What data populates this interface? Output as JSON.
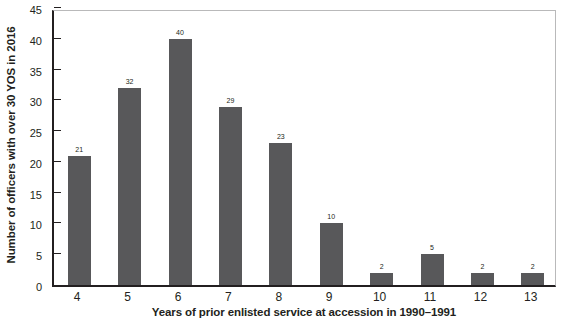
{
  "chart_data": {
    "type": "bar",
    "title": "",
    "xlabel": "Years of prior enlisted service at accession in 1990–1991",
    "ylabel": "Number of officers with over 30 YOS in 2016",
    "categories": [
      "4",
      "5",
      "6",
      "7",
      "8",
      "9",
      "10",
      "11",
      "12",
      "13"
    ],
    "values": [
      21,
      32,
      40,
      29,
      23,
      10,
      2,
      5,
      2,
      2
    ],
    "value_labels": [
      "21",
      "32",
      "40",
      "29",
      "23",
      "10",
      "2",
      "5",
      "2",
      "2"
    ],
    "ylim": [
      0,
      45
    ],
    "yticks": [
      0,
      5,
      10,
      15,
      20,
      25,
      30,
      35,
      40,
      45
    ],
    "ytick_labels": [
      "0",
      "5",
      "10",
      "15",
      "20",
      "25",
      "30",
      "35",
      "40",
      "45"
    ],
    "grid": false,
    "legend": null,
    "bar_color": "#58585a",
    "axis_color": "#231f20",
    "frame_color": "#b9b9ba",
    "background": "#ffffff"
  }
}
